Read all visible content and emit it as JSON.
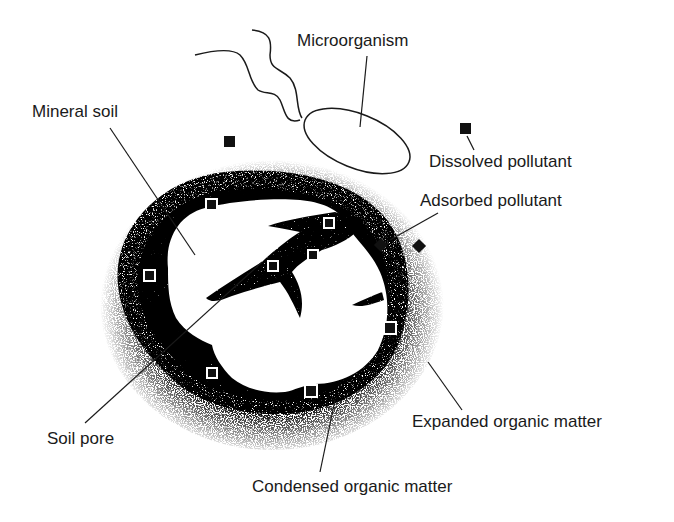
{
  "diagram": {
    "type": "soil-pollutant-sorption-schematic",
    "colors": {
      "ink": "#1a1a1a",
      "background": "#ffffff",
      "pollutant": "#111111"
    },
    "labels": {
      "microorganism": "Microorganism",
      "mineral_soil": "Mineral soil",
      "dissolved_pollutant": "Dissolved pollutant",
      "adsorbed_pollutant": "Adsorbed pollutant",
      "soil_pore": "Soil pore",
      "expanded_organic_matter": "Expanded organic matter",
      "condensed_organic_matter": "Condensed organic matter"
    },
    "components": [
      {
        "id": "microorganism",
        "shape": "ellipse-with-flagella",
        "count_flagella": 2
      },
      {
        "id": "mineral-soil",
        "shape": "white irregular particle"
      },
      {
        "id": "condensed-organic-matter",
        "shape": "dense stippled inner shell"
      },
      {
        "id": "expanded-organic-matter",
        "shape": "sparse stippled outer halo"
      },
      {
        "id": "soil-pore",
        "shape": "stippled branching crack inside particle"
      },
      {
        "id": "dissolved-pollutant",
        "shape": "black square (free in solution)",
        "count": 2
      },
      {
        "id": "adsorbed-pollutant",
        "shape": "black square with white outline (within organic matter)",
        "count": 9
      }
    ]
  }
}
